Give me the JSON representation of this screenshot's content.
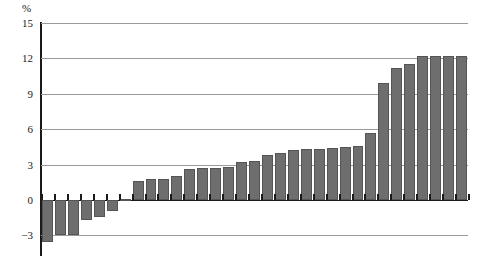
{
  "chart_data": {
    "type": "bar",
    "title": "",
    "subtitle": "",
    "xlabel": "",
    "ylabel": "%",
    "unit_label": "%",
    "ylim": [
      -4.2,
      15
    ],
    "yticks": [
      -3,
      0,
      3,
      6,
      9,
      12,
      15
    ],
    "ytick_labels": [
      "−3",
      "0",
      "3",
      "6",
      "9",
      "12",
      "15"
    ],
    "grid": true,
    "legend": "none",
    "bar_color": "#6e6e6e",
    "bar_edge_color": "#555555",
    "axis_color": "#1a1a1a",
    "gridline_color": "#9a9a9a",
    "categories": [
      "",
      "",
      "",
      "",
      "",
      "",
      "",
      "",
      "",
      "",
      "",
      "",
      "",
      "",
      "",
      "",
      "",
      "",
      "",
      "",
      "",
      "",
      "",
      "",
      "",
      "",
      "",
      "",
      "",
      "",
      "",
      "",
      ""
    ],
    "values": [
      -3.6,
      -3.0,
      -3.0,
      -1.7,
      -1.4,
      -0.9,
      0.1,
      1.6,
      1.8,
      1.8,
      2.0,
      2.6,
      2.7,
      2.7,
      2.8,
      3.2,
      3.3,
      3.8,
      4.0,
      4.2,
      4.3,
      4.3,
      4.4,
      4.5,
      4.6,
      5.7,
      9.9,
      11.2,
      11.5,
      12.2,
      12.2,
      12.2,
      12.2
    ],
    "n_bars": 33
  }
}
